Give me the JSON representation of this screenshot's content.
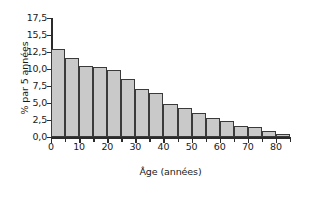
{
  "chart_data": {
    "type": "bar",
    "title": "",
    "subtitle": "",
    "xlabel": "Âge (années)",
    "ylabel": "% par 5 années",
    "grid": false,
    "legend": false,
    "legend_position": "none",
    "bin_width": 5,
    "xlim": [
      0,
      85
    ],
    "ylim": [
      0.0,
      17.5
    ],
    "x_major_tick_labels": [
      "0",
      "10",
      "20",
      "30",
      "40",
      "50",
      "60",
      "70",
      "80"
    ],
    "x_major_tick_values": [
      0,
      10,
      20,
      30,
      40,
      50,
      60,
      70,
      80
    ],
    "x_minor_tick_values": [
      5,
      15,
      25,
      35,
      45,
      55,
      65,
      75,
      85
    ],
    "y_tick_labels": [
      "0,0",
      "2,5",
      "5,0",
      "7,5",
      "10,0",
      "12,5",
      "15,5",
      "17,5"
    ],
    "y_tick_values": [
      0.0,
      2.5,
      5.0,
      7.5,
      10.0,
      12.5,
      15.0,
      17.5
    ],
    "categories": [
      "0-5",
      "5-10",
      "10-15",
      "15-20",
      "20-25",
      "25-30",
      "30-35",
      "35-40",
      "40-45",
      "45-50",
      "50-55",
      "55-60",
      "60-65",
      "65-70",
      "70-75",
      "75-80",
      "80-85"
    ],
    "bin_starts": [
      0,
      5,
      10,
      15,
      20,
      25,
      30,
      35,
      40,
      45,
      50,
      55,
      60,
      65,
      70,
      75,
      80
    ],
    "values": [
      13.0,
      11.6,
      10.5,
      10.3,
      9.8,
      8.6,
      7.1,
      6.4,
      4.9,
      4.2,
      3.6,
      2.8,
      2.4,
      1.6,
      1.4,
      0.9,
      0.4
    ],
    "bar_fill_color": "#c9c9c9",
    "bar_border_color": "#3a3a3a",
    "axis_color": "#2b2b2b",
    "background_color": "#ffffff"
  }
}
